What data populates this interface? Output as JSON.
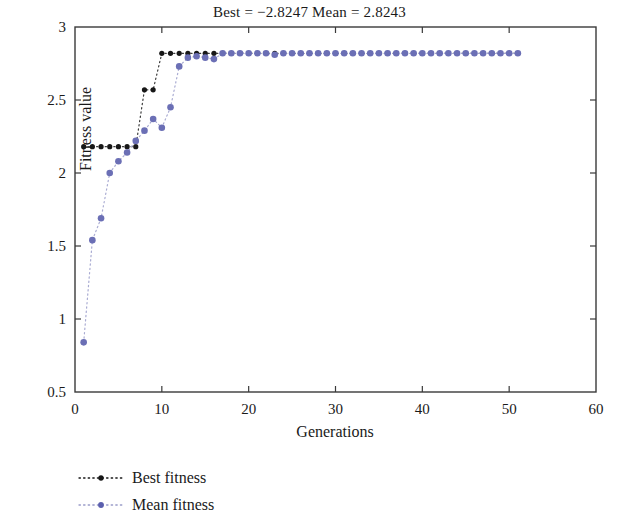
{
  "chart_data": {
    "type": "line",
    "title": "Best = −2.8247 Mean = 2.8243",
    "xlabel": "Generations",
    "ylabel": "Fitness value",
    "xlim": [
      0,
      60
    ],
    "ylim": [
      0.5,
      3
    ],
    "xticks": [
      0,
      10,
      20,
      30,
      40,
      50,
      60
    ],
    "yticks": [
      0.5,
      1,
      1.5,
      2,
      2.5,
      3
    ],
    "xtick_labels": [
      "0",
      "10",
      "20",
      "30",
      "40",
      "50",
      "60"
    ],
    "ytick_labels": [
      "0.5",
      "1",
      "1.5",
      "2",
      "2.5",
      "3"
    ],
    "grid": false,
    "legend_position": "below-left",
    "marker_style": "dotted-line-with-dot-markers",
    "x": [
      1,
      2,
      3,
      4,
      5,
      6,
      7,
      8,
      9,
      10,
      11,
      12,
      13,
      14,
      15,
      16,
      17,
      18,
      19,
      20,
      21,
      22,
      23,
      24,
      25,
      26,
      27,
      28,
      29,
      30,
      31,
      32,
      33,
      34,
      35,
      36,
      37,
      38,
      39,
      40,
      41,
      42,
      43,
      44,
      45,
      46,
      47,
      48,
      49,
      50,
      51
    ],
    "series": [
      {
        "name": "Best fitness",
        "color": "#171717",
        "values": [
          2.18,
          2.18,
          2.18,
          2.18,
          2.18,
          2.18,
          2.18,
          2.57,
          2.57,
          2.82,
          2.82,
          2.82,
          2.82,
          2.82,
          2.82,
          2.82,
          2.82,
          2.82,
          2.82,
          2.82,
          2.82,
          2.82,
          2.82,
          2.82,
          2.82,
          2.82,
          2.82,
          2.82,
          2.82,
          2.82,
          2.82,
          2.82,
          2.82,
          2.82,
          2.82,
          2.82,
          2.82,
          2.82,
          2.82,
          2.82,
          2.82,
          2.82,
          2.82,
          2.82,
          2.82,
          2.82,
          2.82,
          2.82,
          2.82,
          2.82,
          2.82
        ]
      },
      {
        "name": "Mean fitness",
        "color": "#6b6fb5",
        "values": [
          0.84,
          1.54,
          1.69,
          2.0,
          2.08,
          2.14,
          2.22,
          2.29,
          2.37,
          2.31,
          2.45,
          2.73,
          2.79,
          2.8,
          2.79,
          2.78,
          2.82,
          2.82,
          2.82,
          2.82,
          2.82,
          2.82,
          2.81,
          2.82,
          2.82,
          2.82,
          2.82,
          2.82,
          2.82,
          2.82,
          2.82,
          2.82,
          2.82,
          2.82,
          2.82,
          2.82,
          2.82,
          2.82,
          2.82,
          2.82,
          2.82,
          2.82,
          2.82,
          2.82,
          2.82,
          2.82,
          2.82,
          2.82,
          2.82,
          2.82,
          2.82
        ]
      }
    ],
    "legend": [
      {
        "label": "Best fitness",
        "color": "#171717"
      },
      {
        "label": "Mean fitness",
        "color": "#6b6fb5"
      }
    ]
  }
}
